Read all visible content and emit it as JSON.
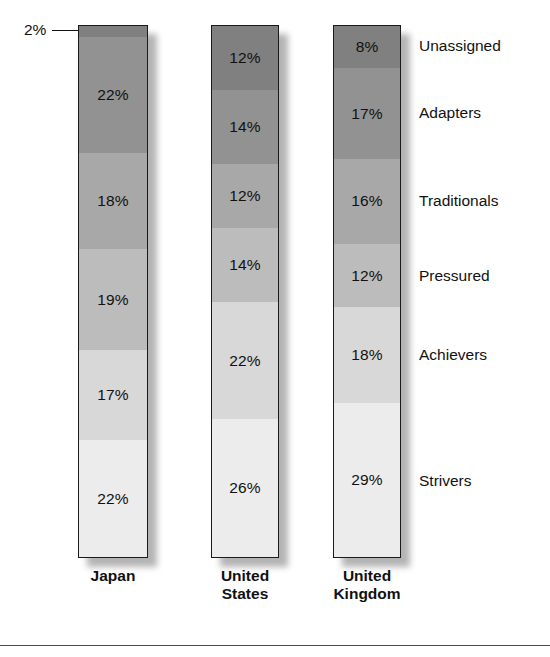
{
  "chart_data": {
    "type": "bar",
    "subtype": "100% stacked bar",
    "title": "",
    "subtitle": "",
    "xlabel": "",
    "ylabel": "",
    "ylim": [
      0,
      100
    ],
    "grid": false,
    "legend_position": "right",
    "orientation": "vertical",
    "stack_order": "top-to-bottom",
    "categories": [
      "Japan",
      "United States",
      "United Kingdom"
    ],
    "series": [
      {
        "name": "Unassigned",
        "color": "#808080",
        "values": [
          2,
          12,
          8
        ]
      },
      {
        "name": "Adapters",
        "color": "#929292",
        "values": [
          22,
          14,
          17
        ]
      },
      {
        "name": "Traditionals",
        "color": "#a8a8a8",
        "values": [
          18,
          12,
          16
        ]
      },
      {
        "name": "Pressured",
        "color": "#bcbcbc",
        "values": [
          19,
          14,
          12
        ]
      },
      {
        "name": "Achievers",
        "color": "#d8d8d8",
        "values": [
          17,
          22,
          18
        ]
      },
      {
        "name": "Strivers",
        "color": "#ececec",
        "values": [
          22,
          26,
          29
        ]
      }
    ],
    "annotations": [
      {
        "text": "2%",
        "target_category": "Japan",
        "target_series": "Unassigned",
        "style": "leader-line callout left of bar"
      }
    ]
  },
  "legend": {
    "items": [
      {
        "label": "Unassigned"
      },
      {
        "label": "Adapters"
      },
      {
        "label": "Traditionals"
      },
      {
        "label": "Pressured"
      },
      {
        "label": "Achievers"
      },
      {
        "label": "Strivers"
      }
    ]
  },
  "axis": {
    "categories": [
      {
        "line1": "Japan",
        "line2": ""
      },
      {
        "line1": "United",
        "line2": "States"
      },
      {
        "line1": "United",
        "line2": "Kingdom"
      }
    ]
  },
  "bars": {
    "japan": {
      "name": "Japan",
      "segments": [
        {
          "label": "2%",
          "value": 2,
          "series": "Unassigned",
          "color": "#808080",
          "label_visible": false
        },
        {
          "label": "22%",
          "value": 22,
          "series": "Adapters",
          "color": "#929292",
          "label_visible": true
        },
        {
          "label": "18%",
          "value": 18,
          "series": "Traditionals",
          "color": "#a8a8a8",
          "label_visible": true
        },
        {
          "label": "19%",
          "value": 19,
          "series": "Pressured",
          "color": "#bcbcbc",
          "label_visible": true
        },
        {
          "label": "17%",
          "value": 17,
          "series": "Achievers",
          "color": "#d8d8d8",
          "label_visible": true
        },
        {
          "label": "22%",
          "value": 22,
          "series": "Strivers",
          "color": "#ececec",
          "label_visible": true
        }
      ]
    },
    "united_states": {
      "name": "United States",
      "segments": [
        {
          "label": "12%",
          "value": 12,
          "series": "Unassigned",
          "color": "#808080",
          "label_visible": true
        },
        {
          "label": "14%",
          "value": 14,
          "series": "Adapters",
          "color": "#929292",
          "label_visible": true
        },
        {
          "label": "12%",
          "value": 12,
          "series": "Traditionals",
          "color": "#a8a8a8",
          "label_visible": true
        },
        {
          "label": "14%",
          "value": 14,
          "series": "Pressured",
          "color": "#bcbcbc",
          "label_visible": true
        },
        {
          "label": "22%",
          "value": 22,
          "series": "Achievers",
          "color": "#d8d8d8",
          "label_visible": true
        },
        {
          "label": "26%",
          "value": 26,
          "series": "Strivers",
          "color": "#ececec",
          "label_visible": true
        }
      ]
    },
    "united_kingdom": {
      "name": "United Kingdom",
      "segments": [
        {
          "label": "8%",
          "value": 8,
          "series": "Unassigned",
          "color": "#808080",
          "label_visible": true
        },
        {
          "label": "17%",
          "value": 17,
          "series": "Adapters",
          "color": "#929292",
          "label_visible": true
        },
        {
          "label": "16%",
          "value": 16,
          "series": "Traditionals",
          "color": "#a8a8a8",
          "label_visible": true
        },
        {
          "label": "12%",
          "value": 12,
          "series": "Pressured",
          "color": "#bcbcbc",
          "label_visible": true
        },
        {
          "label": "18%",
          "value": 18,
          "series": "Achievers",
          "color": "#d8d8d8",
          "label_visible": true
        },
        {
          "label": "29%",
          "value": 29,
          "series": "Strivers",
          "color": "#ececec",
          "label_visible": true
        }
      ]
    }
  },
  "callout": {
    "text": "2%"
  }
}
